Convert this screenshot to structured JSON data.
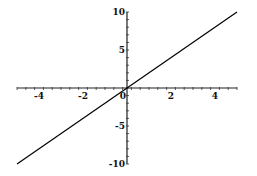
{
  "chart_data": {
    "type": "line",
    "title": "",
    "xlabel": "",
    "ylabel": "",
    "xlim": [
      -5,
      5
    ],
    "ylim": [
      -10,
      10
    ],
    "grid": false,
    "x_ticks_labeled": [
      -4,
      -2,
      0,
      2,
      4
    ],
    "x_tick_labels": [
      "-4",
      "-2",
      "0",
      "2",
      "4"
    ],
    "x_minor_step": 0.4,
    "y_ticks_labeled": [
      10,
      5,
      -5,
      -10
    ],
    "y_tick_labels": [
      "10",
      "5",
      "-5",
      "-10"
    ],
    "y_minor_step": 1,
    "series": [
      {
        "name": "y = 2x",
        "x": [
          -5,
          5
        ],
        "y": [
          -10,
          10
        ],
        "color": "#000000"
      }
    ]
  }
}
